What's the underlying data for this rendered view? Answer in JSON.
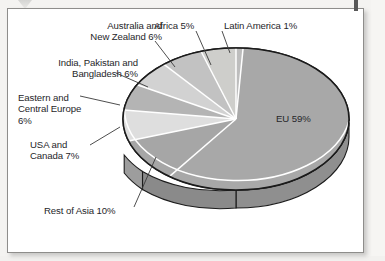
{
  "chart_data": {
    "type": "pie",
    "title": "",
    "subtitle": "",
    "xlabel": "",
    "ylabel": "",
    "grid": false,
    "legend_position": "none",
    "three_d": true,
    "value_unit": "%",
    "categories": [
      "EU",
      "Rest of Asia",
      "USA and Canada",
      "Eastern and Central Europe",
      "India, Pakistan and Bangladesh",
      "Australia and New Zealand",
      "Africa",
      "Latin America"
    ],
    "values": [
      59,
      10,
      7,
      6,
      6,
      6,
      5,
      1
    ],
    "slices": [
      {
        "label": "EU 59%",
        "category": "EU",
        "value": 59,
        "color": "#a8a8a8"
      },
      {
        "label": "Rest of Asia 10%",
        "category": "Rest of Asia",
        "value": 10,
        "color": "#a6a6a6"
      },
      {
        "label": "USA and Canada 7%",
        "category": "USA and Canada",
        "value": 7,
        "color": "#dedede"
      },
      {
        "label": "Eastern and Central Europe 6%",
        "category": "Eastern and Central Europe",
        "value": 6,
        "color": "#b4b4b4"
      },
      {
        "label": "India, Pakistan and Bangladesh 6%",
        "category": "India, Pakistan and Bangladesh",
        "value": 6,
        "color": "#d2d2d2"
      },
      {
        "label": "Australia and New Zealand 6%",
        "category": "Australia and New Zealand",
        "value": 6,
        "color": "#c2c2c2"
      },
      {
        "label": "Africa 5%",
        "category": "Africa",
        "value": 5,
        "color": "#cececb"
      },
      {
        "label": "Latin America 1%",
        "category": "Latin America",
        "value": 1,
        "color": "#bdbdbd"
      }
    ]
  },
  "labels": {
    "eu": "EU 59%",
    "rest_of_asia": "Rest of Asia 10%",
    "usa_canada_line1": "USA and",
    "usa_canada_line2": "Canada 7%",
    "eastern_line1": "Eastern and",
    "eastern_line2": "Central Europe",
    "eastern_line3": "6%",
    "india_line1": "India, Pakistan and",
    "india_line2": "Bangladesh 6%",
    "australia_line1": "Australia and",
    "australia_line2": "New Zealand 6%",
    "africa": "Africa 5%",
    "latin_america": "Latin America 1%"
  },
  "colors": {
    "outline": "#1b1b1b",
    "separator": "#ffffff",
    "frame_border": "#8e8d8b",
    "page_background": "#f4f3f1",
    "plot_background": "#ffffff",
    "text": "#26262a",
    "leader_line": "#3a3a3a"
  }
}
